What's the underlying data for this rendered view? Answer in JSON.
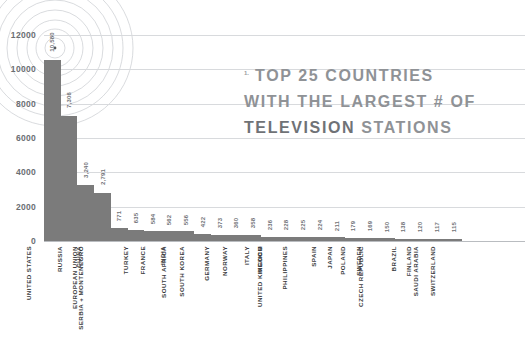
{
  "title": {
    "marker": "1.",
    "line1": "TOP 25 COUNTRIES",
    "line2": "WITH THE LARGEST # OF",
    "line3_strong": "TELEVISION",
    "line3_rest": "STATIONS"
  },
  "colors": {
    "bar": "#7b7b7b",
    "grid": "#d8dadd",
    "baseline": "#b9bcc0",
    "title": "#8f9296",
    "title_strong": "#6f7276",
    "category_label": "#3b3d40",
    "value_label": "#6f7276",
    "ring": "#c9ccd0",
    "background": "#ffffff"
  },
  "decoration": {
    "name": "broadcast-signal-rings",
    "center_x": 55,
    "center_y": 48,
    "radii": [
      10,
      19,
      28,
      38,
      48,
      58,
      68,
      78
    ]
  },
  "chart_data": {
    "type": "bar",
    "title": "1. TOP 25 COUNTRIES WITH THE LARGEST # OF TELEVISION STATIONS",
    "xlabel": "",
    "ylabel": "",
    "ylim": [
      0,
      13000
    ],
    "grid": true,
    "legend": false,
    "yticks": [
      0,
      2000,
      4000,
      6000,
      8000,
      10000,
      12000
    ],
    "ytick_labels": [
      "0",
      "2000",
      "4000",
      "6000",
      "8000",
      "10000",
      "12000"
    ],
    "categories": [
      "UNITED STATES",
      "RUSSIA",
      "CHINA",
      "EUROPEAN UNION",
      "SERBIA + MONTENEGRO",
      "TURKEY",
      "FRANCE",
      "INDIA",
      "SOUTH AFRICA",
      "SOUTH KOREA",
      "GERMANY",
      "NORWAY",
      "ITALY",
      "MEXICO",
      "UNITED KINGDOM",
      "PHILIPPINES",
      "SPAIN",
      "JAPAN",
      "POLAND",
      "SWEDEN",
      "CZECH REPUBLIC",
      "BRAZIL",
      "FINLAND",
      "SAUDI ARABIA",
      "SWITZERLAND"
    ],
    "values": [
      10580,
      7306,
      3240,
      2791,
      771,
      635,
      584,
      562,
      556,
      422,
      373,
      360,
      358,
      236,
      228,
      225,
      224,
      211,
      179,
      169,
      150,
      138,
      120,
      117,
      115
    ],
    "value_labels": [
      "10,580",
      "7,306",
      "3,240",
      "2,791",
      "771",
      "635",
      "584",
      "562",
      "556",
      "422",
      "373",
      "360",
      "358",
      "236",
      "228",
      "225",
      "224",
      "211",
      "179",
      "169",
      "150",
      "138",
      "120",
      "117",
      "115"
    ]
  }
}
